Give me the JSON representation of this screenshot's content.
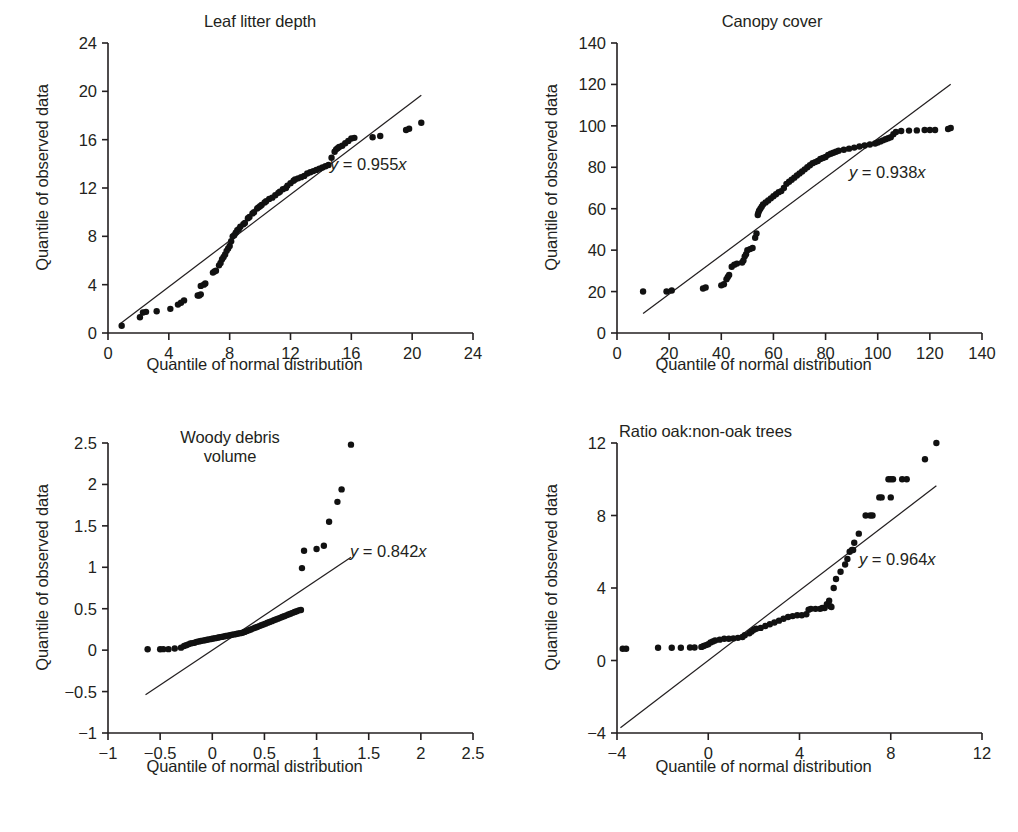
{
  "figure": {
    "axis_color": "#231f20",
    "point_color": "#111111",
    "caption": "",
    "shared": {
      "ylabel": "Quantile of observed data",
      "xlabel": "Quantile of normal distribution"
    }
  },
  "chart_data": [
    {
      "type": "scatter",
      "id": "leaf-litter-depth",
      "title": "Leaf litter depth",
      "xlabel": "Quantile of normal distribution",
      "ylabel": "Quantile of observed data",
      "annotation": "y = 0.955x",
      "slope": 0.955,
      "grid": false,
      "legend": "none",
      "xlim": [
        0,
        24
      ],
      "ylim": [
        0,
        24
      ],
      "xticks": [
        0,
        4,
        8,
        12,
        16,
        20,
        24
      ],
      "yticks": [
        0,
        4,
        8,
        12,
        16,
        20,
        24
      ],
      "fit_line": {
        "x": [
          0.8,
          20.6
        ],
        "y": [
          0.764,
          19.673
        ]
      },
      "points": [
        [
          0.9,
          0.6
        ],
        [
          2.1,
          1.3
        ],
        [
          2.3,
          1.7
        ],
        [
          2.5,
          1.75
        ],
        [
          3.2,
          1.8
        ],
        [
          4.1,
          2.0
        ],
        [
          4.6,
          2.35
        ],
        [
          4.8,
          2.5
        ],
        [
          5.0,
          2.7
        ],
        [
          5.9,
          3.1
        ],
        [
          6.0,
          3.1
        ],
        [
          6.1,
          3.2
        ],
        [
          6.1,
          3.9
        ],
        [
          6.3,
          4.0
        ],
        [
          6.4,
          4.1
        ],
        [
          6.9,
          5.0
        ],
        [
          7.0,
          5.1
        ],
        [
          7.1,
          5.15
        ],
        [
          7.3,
          5.6
        ],
        [
          7.4,
          5.8
        ],
        [
          7.5,
          6.1
        ],
        [
          7.6,
          6.3
        ],
        [
          7.7,
          6.5
        ],
        [
          7.8,
          6.8
        ],
        [
          7.9,
          7.0
        ],
        [
          8.0,
          7.2
        ],
        [
          8.1,
          7.6
        ],
        [
          8.2,
          8.0
        ],
        [
          8.3,
          8.1
        ],
        [
          8.4,
          8.3
        ],
        [
          8.5,
          8.5
        ],
        [
          8.6,
          8.6
        ],
        [
          8.7,
          8.8
        ],
        [
          8.9,
          9.0
        ],
        [
          9.0,
          9.1
        ],
        [
          9.2,
          9.5
        ],
        [
          9.3,
          9.6
        ],
        [
          9.5,
          9.9
        ],
        [
          9.6,
          10.0
        ],
        [
          9.8,
          10.3
        ],
        [
          9.9,
          10.4
        ],
        [
          10.0,
          10.5
        ],
        [
          10.1,
          10.6
        ],
        [
          10.3,
          10.8
        ],
        [
          10.4,
          10.9
        ],
        [
          10.6,
          11.1
        ],
        [
          10.8,
          11.2
        ],
        [
          11.0,
          11.4
        ],
        [
          11.2,
          11.6
        ],
        [
          11.3,
          11.7
        ],
        [
          11.5,
          11.9
        ],
        [
          11.7,
          12.0
        ],
        [
          11.8,
          12.2
        ],
        [
          12.0,
          12.4
        ],
        [
          12.2,
          12.6
        ],
        [
          12.3,
          12.7
        ],
        [
          12.5,
          12.8
        ],
        [
          12.7,
          12.9
        ],
        [
          12.9,
          13.0
        ],
        [
          13.1,
          13.2
        ],
        [
          13.3,
          13.3
        ],
        [
          13.5,
          13.4
        ],
        [
          13.7,
          13.5
        ],
        [
          13.9,
          13.6
        ],
        [
          14.1,
          13.7
        ],
        [
          14.3,
          13.8
        ],
        [
          14.5,
          13.9
        ],
        [
          14.7,
          14.5
        ],
        [
          14.9,
          15.0
        ],
        [
          15.0,
          15.2
        ],
        [
          15.1,
          15.3
        ],
        [
          15.2,
          15.4
        ],
        [
          15.4,
          15.5
        ],
        [
          15.6,
          15.7
        ],
        [
          15.8,
          15.9
        ],
        [
          16.0,
          16.1
        ],
        [
          16.2,
          16.15
        ],
        [
          17.4,
          16.2
        ],
        [
          17.9,
          16.3
        ],
        [
          19.6,
          16.8
        ],
        [
          19.8,
          16.9
        ],
        [
          20.6,
          17.4
        ]
      ]
    },
    {
      "type": "scatter",
      "id": "canopy-cover",
      "title": "Canopy cover",
      "xlabel": "Quantile of normal distribution",
      "ylabel": "Quantile of observed data",
      "annotation": "y = 0.938x",
      "slope": 0.938,
      "grid": false,
      "legend": "none",
      "xlim": [
        0,
        140
      ],
      "ylim": [
        0,
        140
      ],
      "xticks": [
        0,
        20,
        40,
        60,
        80,
        100,
        120,
        140
      ],
      "yticks": [
        0,
        20,
        40,
        60,
        80,
        100,
        120,
        140
      ],
      "fit_line": {
        "x": [
          10,
          128
        ],
        "y": [
          9.38,
          120.06
        ]
      },
      "points": [
        [
          10,
          20
        ],
        [
          19,
          20
        ],
        [
          21,
          20.5
        ],
        [
          33,
          21.5
        ],
        [
          34,
          22
        ],
        [
          40,
          23
        ],
        [
          41,
          23.5
        ],
        [
          42,
          26
        ],
        [
          42.5,
          27
        ],
        [
          43,
          28
        ],
        [
          44,
          32
        ],
        [
          45,
          33
        ],
        [
          46,
          33.5
        ],
        [
          48,
          34
        ],
        [
          48.5,
          35
        ],
        [
          49,
          37
        ],
        [
          49.5,
          38
        ],
        [
          50,
          40
        ],
        [
          51,
          40.5
        ],
        [
          52,
          41
        ],
        [
          53,
          46
        ],
        [
          53.5,
          48
        ],
        [
          54,
          57
        ],
        [
          54.2,
          58
        ],
        [
          54.5,
          59
        ],
        [
          55,
          60
        ],
        [
          55.5,
          61
        ],
        [
          56,
          62
        ],
        [
          57,
          63
        ],
        [
          58,
          64
        ],
        [
          59,
          65
        ],
        [
          60,
          66
        ],
        [
          61,
          67
        ],
        [
          62,
          68
        ],
        [
          63,
          68.5
        ],
        [
          64,
          70
        ],
        [
          65,
          72
        ],
        [
          66,
          73
        ],
        [
          67,
          74
        ],
        [
          68,
          75
        ],
        [
          69,
          76
        ],
        [
          70,
          77
        ],
        [
          71,
          78
        ],
        [
          72,
          79
        ],
        [
          73,
          80
        ],
        [
          74,
          81
        ],
        [
          75,
          82
        ],
        [
          76,
          82.5
        ],
        [
          77,
          83
        ],
        [
          78,
          84
        ],
        [
          79,
          84.5
        ],
        [
          80,
          85
        ],
        [
          81,
          86
        ],
        [
          82,
          86.5
        ],
        [
          83,
          87
        ],
        [
          84,
          87.5
        ],
        [
          85,
          88
        ],
        [
          87,
          88.5
        ],
        [
          89,
          89
        ],
        [
          91,
          89.5
        ],
        [
          93,
          90
        ],
        [
          95,
          90.5
        ],
        [
          97,
          91
        ],
        [
          99,
          91.5
        ],
        [
          100,
          92
        ],
        [
          101,
          92.5
        ],
        [
          102,
          93
        ],
        [
          103,
          93.5
        ],
        [
          104,
          94
        ],
        [
          105,
          94.5
        ],
        [
          106,
          96
        ],
        [
          107,
          97
        ],
        [
          109,
          97.5
        ],
        [
          112,
          97.7
        ],
        [
          115,
          97.8
        ],
        [
          118,
          98
        ],
        [
          120,
          98
        ],
        [
          122,
          98
        ],
        [
          127,
          98.5
        ],
        [
          128,
          99
        ]
      ]
    },
    {
      "type": "scatter",
      "id": "woody-debris-volume",
      "title": "Woody debris\nvolume",
      "xlabel": "Quantile of normal distribution",
      "ylabel": "Quantile of observed data",
      "annotation": "y = 0.842x",
      "slope": 0.842,
      "grid": false,
      "legend": "none",
      "xlim": [
        -1,
        2.5
      ],
      "ylim": [
        -1,
        2.5
      ],
      "xticks": [
        -1,
        -0.5,
        0,
        0.5,
        1,
        1.5,
        2,
        2.5
      ],
      "yticks": [
        -1,
        -0.5,
        0,
        0.5,
        1,
        1.5,
        2,
        2.5
      ],
      "ytick_labels": [
        "−1",
        "−0.5",
        "0",
        "0.5",
        "1",
        "1.5",
        "2",
        "2.5"
      ],
      "xtick_labels": [
        "−1",
        "−0.5",
        "0",
        "0.5",
        "1",
        "1.5",
        "2",
        "2.5"
      ],
      "fit_line": {
        "x": [
          -0.64,
          1.33
        ],
        "y": [
          -0.539,
          1.12
        ]
      },
      "points": [
        [
          -0.62,
          0.01
        ],
        [
          -0.5,
          0.01
        ],
        [
          -0.47,
          0.012
        ],
        [
          -0.42,
          0.012
        ],
        [
          -0.36,
          0.02
        ],
        [
          -0.3,
          0.03
        ],
        [
          -0.27,
          0.05
        ],
        [
          -0.25,
          0.06
        ],
        [
          -0.23,
          0.07
        ],
        [
          -0.21,
          0.08
        ],
        [
          -0.19,
          0.085
        ],
        [
          -0.17,
          0.09
        ],
        [
          -0.15,
          0.1
        ],
        [
          -0.13,
          0.105
        ],
        [
          -0.11,
          0.11
        ],
        [
          -0.09,
          0.115
        ],
        [
          -0.07,
          0.12
        ],
        [
          -0.05,
          0.125
        ],
        [
          -0.03,
          0.13
        ],
        [
          -0.01,
          0.135
        ],
        [
          0.01,
          0.14
        ],
        [
          0.03,
          0.145
        ],
        [
          0.05,
          0.15
        ],
        [
          0.07,
          0.155
        ],
        [
          0.09,
          0.16
        ],
        [
          0.11,
          0.165
        ],
        [
          0.13,
          0.17
        ],
        [
          0.15,
          0.175
        ],
        [
          0.17,
          0.18
        ],
        [
          0.19,
          0.185
        ],
        [
          0.21,
          0.19
        ],
        [
          0.23,
          0.195
        ],
        [
          0.25,
          0.2
        ],
        [
          0.27,
          0.205
        ],
        [
          0.29,
          0.21
        ],
        [
          0.31,
          0.22
        ],
        [
          0.33,
          0.23
        ],
        [
          0.35,
          0.24
        ],
        [
          0.37,
          0.25
        ],
        [
          0.39,
          0.26
        ],
        [
          0.41,
          0.27
        ],
        [
          0.43,
          0.28
        ],
        [
          0.45,
          0.29
        ],
        [
          0.47,
          0.3
        ],
        [
          0.49,
          0.31
        ],
        [
          0.51,
          0.32
        ],
        [
          0.53,
          0.33
        ],
        [
          0.55,
          0.34
        ],
        [
          0.57,
          0.35
        ],
        [
          0.59,
          0.36
        ],
        [
          0.61,
          0.37
        ],
        [
          0.63,
          0.38
        ],
        [
          0.65,
          0.39
        ],
        [
          0.67,
          0.4
        ],
        [
          0.69,
          0.41
        ],
        [
          0.71,
          0.42
        ],
        [
          0.73,
          0.43
        ],
        [
          0.75,
          0.44
        ],
        [
          0.77,
          0.45
        ],
        [
          0.79,
          0.46
        ],
        [
          0.81,
          0.47
        ],
        [
          0.83,
          0.48
        ],
        [
          0.85,
          0.485
        ],
        [
          0.86,
          0.99
        ],
        [
          0.88,
          1.2
        ],
        [
          1.0,
          1.22
        ],
        [
          1.07,
          1.26
        ],
        [
          1.12,
          1.55
        ],
        [
          1.2,
          1.79
        ],
        [
          1.24,
          1.94
        ],
        [
          1.33,
          2.48
        ]
      ]
    },
    {
      "type": "scatter",
      "id": "ratio-oak-non-oak-trees",
      "title": "Ratio oak:non-oak trees",
      "xlabel": "Quantile of normal distribution",
      "ylabel": "Quantile of observed data",
      "annotation": "y = 0.964x",
      "slope": 0.964,
      "grid": false,
      "legend": "none",
      "xlim": [
        -4,
        12
      ],
      "ylim": [
        -4,
        12
      ],
      "xticks": [
        -4,
        0,
        4,
        8,
        12
      ],
      "yticks": [
        -4,
        0,
        4,
        8,
        12
      ],
      "ytick_labels": [
        "−4",
        "0",
        "4",
        "8",
        "12"
      ],
      "xtick_labels": [
        "−4",
        "0",
        "4",
        "8",
        "12"
      ],
      "fit_line": {
        "x": [
          -3.85,
          10.0
        ],
        "y": [
          -3.71,
          9.64
        ]
      },
      "points": [
        [
          -3.75,
          0.65
        ],
        [
          -3.6,
          0.65
        ],
        [
          -2.2,
          0.7
        ],
        [
          -1.6,
          0.7
        ],
        [
          -1.2,
          0.7
        ],
        [
          -0.8,
          0.72
        ],
        [
          -0.6,
          0.72
        ],
        [
          -0.3,
          0.75
        ],
        [
          -0.2,
          0.8
        ],
        [
          -0.1,
          0.85
        ],
        [
          0.0,
          0.9
        ],
        [
          0.1,
          1.0
        ],
        [
          0.2,
          1.05
        ],
        [
          0.3,
          1.1
        ],
        [
          0.5,
          1.15
        ],
        [
          0.7,
          1.2
        ],
        [
          0.9,
          1.2
        ],
        [
          1.1,
          1.22
        ],
        [
          1.3,
          1.25
        ],
        [
          1.5,
          1.3
        ],
        [
          1.6,
          1.4
        ],
        [
          1.8,
          1.5
        ],
        [
          1.9,
          1.6
        ],
        [
          2.0,
          1.7
        ],
        [
          2.1,
          1.75
        ],
        [
          2.3,
          1.8
        ],
        [
          2.5,
          1.9
        ],
        [
          2.7,
          2.0
        ],
        [
          2.9,
          2.1
        ],
        [
          3.1,
          2.2
        ],
        [
          3.3,
          2.3
        ],
        [
          3.5,
          2.4
        ],
        [
          3.7,
          2.45
        ],
        [
          3.9,
          2.5
        ],
        [
          4.1,
          2.5
        ],
        [
          4.3,
          2.55
        ],
        [
          4.4,
          2.8
        ],
        [
          4.5,
          2.85
        ],
        [
          4.7,
          2.85
        ],
        [
          4.9,
          2.85
        ],
        [
          5.0,
          2.9
        ],
        [
          5.1,
          2.9
        ],
        [
          5.2,
          3.1
        ],
        [
          5.3,
          3.3
        ],
        [
          5.35,
          3.0
        ],
        [
          5.4,
          2.95
        ],
        [
          5.5,
          4.0
        ],
        [
          5.6,
          4.5
        ],
        [
          5.8,
          4.9
        ],
        [
          6.0,
          5.3
        ],
        [
          6.1,
          5.6
        ],
        [
          6.2,
          6.0
        ],
        [
          6.3,
          6.1
        ],
        [
          6.35,
          6.1
        ],
        [
          6.4,
          6.5
        ],
        [
          6.6,
          7.0
        ],
        [
          6.9,
          8.0
        ],
        [
          7.1,
          8.0
        ],
        [
          7.2,
          8.0
        ],
        [
          7.5,
          9.0
        ],
        [
          7.6,
          9.0
        ],
        [
          8.0,
          9.0
        ],
        [
          7.9,
          10.0
        ],
        [
          8.0,
          10.0
        ],
        [
          8.1,
          10.0
        ],
        [
          8.5,
          10.0
        ],
        [
          8.7,
          10.0
        ],
        [
          9.5,
          11.1
        ],
        [
          10.0,
          12.0
        ]
      ]
    }
  ]
}
